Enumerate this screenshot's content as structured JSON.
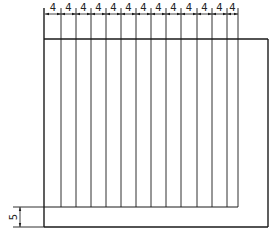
{
  "diagram": {
    "title": "",
    "stroke_color": "#1a1a1a",
    "outer_rect": {
      "x": 44,
      "y": 39,
      "w": 224,
      "h": 188
    },
    "inner_line_y": 207,
    "vertical_lines_x": [
      45,
      61,
      76,
      91,
      106,
      121,
      136,
      151,
      166,
      181,
      197,
      212,
      227,
      238
    ],
    "top_dimensions": {
      "labels": [
        "4",
        "4",
        "4",
        "4",
        "4",
        "4",
        "4",
        "4",
        "4",
        "4",
        "4",
        "4",
        "4"
      ],
      "y": 14
    },
    "side_dimension": {
      "label": "5",
      "y_top": 207,
      "y_bottom": 227,
      "x": 20
    }
  }
}
